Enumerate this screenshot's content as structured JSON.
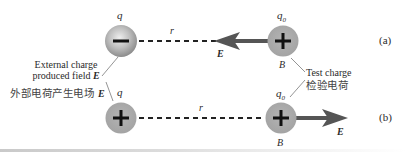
{
  "diagram": {
    "panels": [
      {
        "id": "a",
        "tag": "(a)",
        "source_charge": {
          "label": "q",
          "sign": "−",
          "type": "negative"
        },
        "separation_label": "r",
        "test_charge": {
          "label": "q",
          "subscript": "0",
          "sign": "+",
          "point_label": "B"
        },
        "field": {
          "label": "E",
          "direction": "left"
        }
      },
      {
        "id": "b",
        "tag": "(b)",
        "source_charge": {
          "label": "q",
          "sign": "+",
          "type": "positive"
        },
        "separation_label": "r",
        "test_charge": {
          "label": "q",
          "subscript": "0",
          "sign": "+",
          "point_label": "B"
        },
        "field": {
          "label": "E",
          "direction": "right"
        }
      }
    ],
    "annotations": {
      "external": {
        "line1": "External charge",
        "line2": "produced field",
        "line2_symbol": "E",
        "chinese": "外部电荷产生电场",
        "chinese_symbol": "E"
      },
      "test": {
        "line1": "Test charge",
        "chinese": "检验电荷"
      }
    },
    "colors": {
      "negative_charge_center": "#e6e6e6",
      "negative_charge_edge": "#8a8a8a",
      "positive_charge_fill": "#a9a9a9",
      "arrow": "#555555",
      "dashed_line": "#222222",
      "leader_line": "#888888"
    }
  }
}
